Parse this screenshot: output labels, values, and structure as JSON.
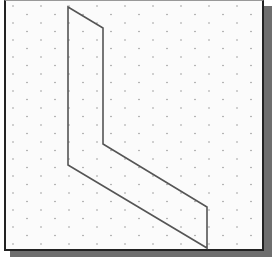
{
  "diagram": {
    "type": "isometric-grid-drawing",
    "background": "#fbfbfb",
    "frame_color": "#222222",
    "shadow_color": "#6e6e6e",
    "grid": {
      "style": "isometric-dots",
      "dot_color": "#9a9a9a",
      "spacing_x": 28,
      "spacing_y": 17
    },
    "shape": {
      "name": "L-shaped isometric face",
      "stroke": "#555555",
      "points": "68,7 103,28 103,144 207,207 207,248 68,165"
    }
  }
}
